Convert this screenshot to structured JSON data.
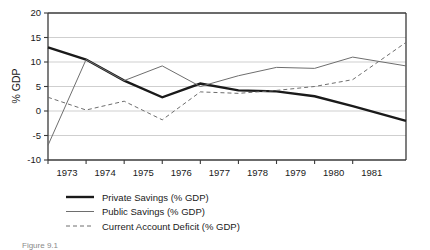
{
  "chart_data": {
    "type": "line",
    "title": "",
    "xlabel": "",
    "ylabel": "% GDP",
    "xlim": [
      1972.5,
      1981.9
    ],
    "ylim": [
      -10,
      20
    ],
    "yticks": [
      -10,
      -5,
      0,
      5,
      10,
      15,
      20
    ],
    "ytick_labels": [
      "-10",
      "-5",
      "0",
      "5",
      "10",
      "15",
      "20"
    ],
    "xticks": [
      1973,
      1974,
      1975,
      1976,
      1977,
      1978,
      1979,
      1980,
      1981
    ],
    "xtick_labels": [
      "1973",
      "1974",
      "1975",
      "1976",
      "1977",
      "1978",
      "1979",
      "1980",
      "1981"
    ],
    "grid": true,
    "grid_axis": "y",
    "legend_position": "below-center",
    "series": [
      {
        "name": "Private Savings (% GDP)",
        "style": "solid-thick",
        "color": "#1a1a1a",
        "width": 2.4,
        "x": [
          1972.5,
          1973.5,
          1974.5,
          1975.5,
          1976.5,
          1977.5,
          1978.5,
          1979.5,
          1980.5,
          1981.9
        ],
        "values": [
          13.0,
          10.5,
          6.2,
          2.8,
          5.6,
          4.2,
          4.0,
          3.0,
          1.0,
          -2.0
        ]
      },
      {
        "name": "Public Savings (% GDP)",
        "style": "solid-thin",
        "color": "#6e6e6e",
        "width": 1.0,
        "x": [
          1972.5,
          1973.5,
          1974.5,
          1975.5,
          1976.5,
          1977.5,
          1978.5,
          1979.5,
          1980.5,
          1981.9
        ],
        "values": [
          -7.0,
          10.5,
          6.2,
          9.2,
          5.0,
          7.2,
          8.9,
          8.7,
          11.0,
          9.2
        ]
      },
      {
        "name": "Current Account Deficit (% GDP)",
        "style": "dashed",
        "color": "#6e6e6e",
        "width": 1.0,
        "x": [
          1972.5,
          1973.5,
          1974.5,
          1975.5,
          1976.5,
          1977.5,
          1978.5,
          1979.5,
          1980.5,
          1981.9
        ],
        "values": [
          2.8,
          0.2,
          2.0,
          -1.8,
          3.9,
          3.6,
          4.2,
          5.0,
          6.4,
          14.0
        ]
      }
    ]
  },
  "legend": {
    "items": [
      {
        "label": "Private Savings (% GDP)",
        "style": "solid-thick"
      },
      {
        "label": "Public Savings (% GDP)",
        "style": "solid-thin"
      },
      {
        "label": "Current Account Deficit (% GDP)",
        "style": "dashed"
      }
    ]
  },
  "caption": {
    "text": "Figure 9.1"
  }
}
